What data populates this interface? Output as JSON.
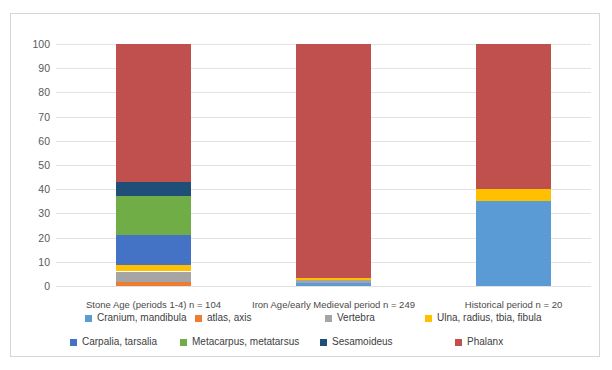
{
  "chart_data": {
    "type": "bar",
    "subtype": "stacked-100-percent",
    "title": "",
    "xlabel": "",
    "ylabel": "",
    "ylim": [
      0,
      100
    ],
    "yticks": [
      0,
      10,
      20,
      30,
      40,
      50,
      60,
      70,
      80,
      90,
      100
    ],
    "grid": true,
    "legend_position": "bottom",
    "categories": [
      "Stone Age (periods 1-4) n = 104",
      "Iron Age/early Medieval period n = 249",
      "Historical period n = 20"
    ],
    "series": [
      {
        "name": "Cranium, mandibula",
        "color": "#5b9bd5",
        "values": [
          0.0,
          1.2,
          35.0
        ]
      },
      {
        "name": "atlas, axis",
        "color": "#ed7d31",
        "values": [
          1.5,
          0.0,
          0.0
        ]
      },
      {
        "name": "Vertebra",
        "color": "#a5a5a5",
        "values": [
          4.5,
          1.2,
          0.0
        ]
      },
      {
        "name": "Ulna, radius, tbia, fibula",
        "color": "#ffc000",
        "values": [
          2.5,
          0.8,
          5.0
        ]
      },
      {
        "name": "Carpalia, tarsalia",
        "color": "#4472c4",
        "values": [
          12.5,
          0.0,
          0.0
        ]
      },
      {
        "name": "Metacarpus, metatarsus",
        "color": "#70ad47",
        "values": [
          16.0,
          0.0,
          0.0
        ]
      },
      {
        "name": "Sesamoideus",
        "color": "#1f4e79",
        "values": [
          6.0,
          0.0,
          0.0
        ]
      },
      {
        "name": "Phalanx",
        "color": "#c0504d",
        "values": [
          57.0,
          96.8,
          60.0
        ]
      }
    ]
  },
  "axis": {
    "y_tick_labels": [
      "0",
      "10",
      "20",
      "30",
      "40",
      "50",
      "60",
      "70",
      "80",
      "90",
      "100"
    ]
  },
  "colors": {
    "phalanx": "#c0504d",
    "plot_background": "#ffffff",
    "gridline": "#e2e2e2",
    "frame_border": "#d6d6d6"
  }
}
